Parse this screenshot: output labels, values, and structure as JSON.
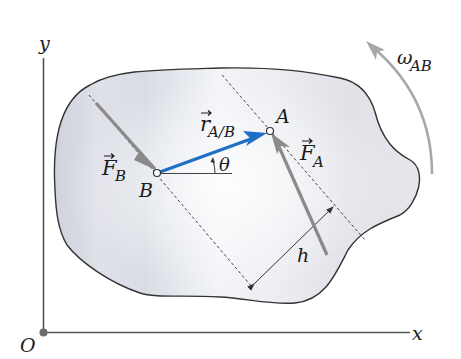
{
  "diagram": {
    "type": "rigid-body-couple",
    "axes": {
      "x_label": "x",
      "y_label": "y",
      "origin_label": "O"
    },
    "points": {
      "A": {
        "label": "A"
      },
      "B": {
        "label": "B"
      }
    },
    "vectors": {
      "F_A": {
        "symbol": "F",
        "subscript": "A",
        "color": "#8a8a8a"
      },
      "F_B": {
        "symbol": "F",
        "subscript": "B",
        "color": "#8a8a8a"
      },
      "r_AB": {
        "symbol": "r",
        "subscript": "A/B",
        "color": "#1f6fc4"
      }
    },
    "angle": {
      "label": "θ"
    },
    "distance": {
      "label": "h"
    },
    "angular_velocity": {
      "symbol": "ω",
      "subscript": "AB",
      "color": "#a8a8a8"
    },
    "colors": {
      "body_fill": "#e6e8ee",
      "body_outline": "#333333",
      "axis": "#555555",
      "force_arrow": "#8a8a8a",
      "position_vector": "#1f6fc4"
    }
  }
}
